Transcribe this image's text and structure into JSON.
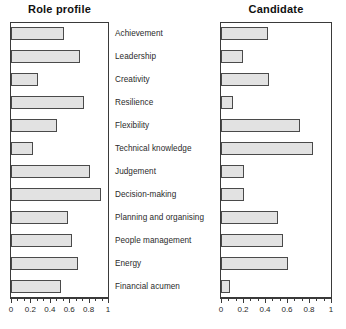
{
  "chart_data": {
    "type": "bar",
    "title": "",
    "orientation": "horizontal",
    "categories": [
      "Achievement",
      "Leadership",
      "Creativity",
      "Resilience",
      "Flexibility",
      "Technical knowledge",
      "Judgement",
      "Decision-making",
      "Planning and organising",
      "People management",
      "Energy",
      "Financial acumen"
    ],
    "series": [
      {
        "name": "Role profile",
        "values": [
          0.55,
          0.71,
          0.28,
          0.75,
          0.47,
          0.23,
          0.81,
          0.93,
          0.59,
          0.63,
          0.69,
          0.52
        ]
      },
      {
        "name": "Candidate",
        "values": [
          0.43,
          0.2,
          0.44,
          0.11,
          0.72,
          0.84,
          0.21,
          0.21,
          0.52,
          0.56,
          0.61,
          0.08
        ]
      }
    ],
    "xlabel": "",
    "ylabel": "",
    "xlim": [
      0,
      1
    ],
    "xticks": [
      0,
      0.2,
      0.4,
      0.6,
      0.8,
      1
    ],
    "xticklabels": [
      "0",
      "0.2",
      "0.4",
      "0.6",
      "0.8",
      "1"
    ],
    "minor_ticks_per_interval": 2,
    "grid": false,
    "legend": "none",
    "bar_fill_color": "#e2e2e2",
    "bar_border_color": "#4a4a4a",
    "axis_color": "#3a3a3a"
  },
  "panels": {
    "left": {
      "title": "Role profile",
      "series_index": 0
    },
    "right": {
      "title": "Candidate",
      "series_index": 1
    }
  }
}
